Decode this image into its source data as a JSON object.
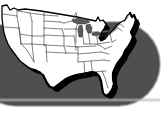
{
  "graphic": {
    "type": "map-illustration",
    "title": "Map of the Continental United States",
    "subject": "United States of America",
    "region": "Contiguous 48 states (lower 48)",
    "projection_look": "flat outline map with state borders",
    "alt_text": "Black and white outline map of the continental United States showing state boundaries, with a drop shadow, placed on a dark gray rounded pill-shaped background."
  },
  "style": {
    "page_background": "#ffffff",
    "backdrop_fill": "#4f4f4f",
    "backdrop_shape": "rounded-pill",
    "land_fill": "#ffffff",
    "border_stroke": "#404040",
    "outline_stroke": "#000000",
    "shadow_fill": "#000000",
    "lake_fill": "#5a5a5a"
  },
  "backdrop": {
    "name": "gray-pill-backdrop",
    "x": -26,
    "y": 22,
    "width": 186,
    "height": 84,
    "corner_radius": 42
  },
  "map": {
    "name": "usa-outline",
    "shadow_offset_x": 3,
    "shadow_offset_y": 4,
    "state_count": 48,
    "lakes": [
      "Lake Superior",
      "Lake Michigan",
      "Lake Huron",
      "Lake Erie",
      "Lake Ontario"
    ],
    "labels_visible": false,
    "legend_visible": false
  },
  "chart_data": {
    "type": "map",
    "title": "Map of the Continental United States",
    "categories": [],
    "values": [],
    "annotations": []
  }
}
